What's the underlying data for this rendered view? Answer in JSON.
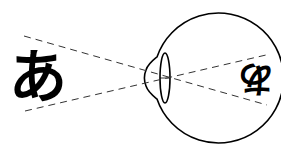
{
  "diagram": {
    "object": {
      "label": "あ",
      "description": "upright object character"
    },
    "retinal_image": {
      "label": "あ",
      "description": "inverted image on retina (rotated 180°)"
    },
    "parts": [
      {
        "name": "eyeball",
        "description": "circular eyeball outline with cornea bulge"
      },
      {
        "name": "lens",
        "description": "biconvex lens"
      },
      {
        "name": "light-rays",
        "description": "two dashed lines crossing at the lens"
      }
    ],
    "colors": {
      "stroke": "#000000",
      "background": "#ffffff"
    }
  }
}
